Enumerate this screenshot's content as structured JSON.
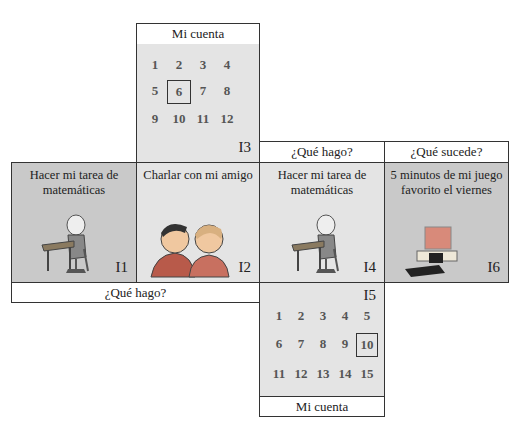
{
  "top": {
    "header": "Mi cuenta",
    "numbers": [
      "1",
      "2",
      "3",
      "4",
      "5",
      "6",
      "7",
      "8",
      "9",
      "10",
      "11",
      "12"
    ],
    "selected": "6",
    "label": "I3"
  },
  "cards": [
    {
      "id": "I1",
      "title": "Hacer mi tarea de matemáticas",
      "icon": "student-at-desk-icon"
    },
    {
      "id": "I2",
      "title": "Charlar con mi amigo",
      "icon": "friends-talking-icon"
    },
    {
      "id": "I4",
      "title": "Hacer mi tarea de matemáticas",
      "icon": "student-at-desk-icon"
    },
    {
      "id": "I6",
      "title": "5 minutos de mi juego favorito el viernes",
      "icon": "computer-icon"
    }
  ],
  "headers": {
    "i4": "¿Qué hago?",
    "i6": "¿Qué sucede?",
    "bottom_left": "¿Qué hago?"
  },
  "bottom": {
    "label": "I5",
    "numbers": [
      "1",
      "2",
      "3",
      "4",
      "5",
      "6",
      "7",
      "8",
      "9",
      "10",
      "11",
      "12",
      "13",
      "14",
      "15"
    ],
    "selected": "10",
    "footer": "Mi cuenta"
  },
  "colors": {
    "light_panel": "#e4e4e4",
    "dark_panel": "#c9c9c9",
    "border": "#333333"
  }
}
